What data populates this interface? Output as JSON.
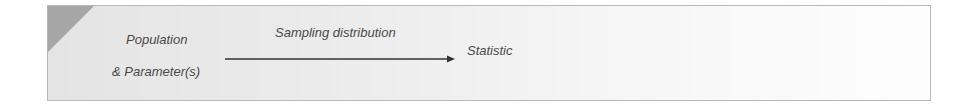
{
  "diagram": {
    "source_node": {
      "line1": "Population",
      "line2": "& Parameter(s)"
    },
    "edge": {
      "label": "Sampling distribution",
      "direction": "right"
    },
    "target_node": {
      "label": "Statistic"
    },
    "colors": {
      "corner_accent": "#a6a6a6",
      "text": "#4a4a4a",
      "border": "#b8b8b8"
    }
  }
}
